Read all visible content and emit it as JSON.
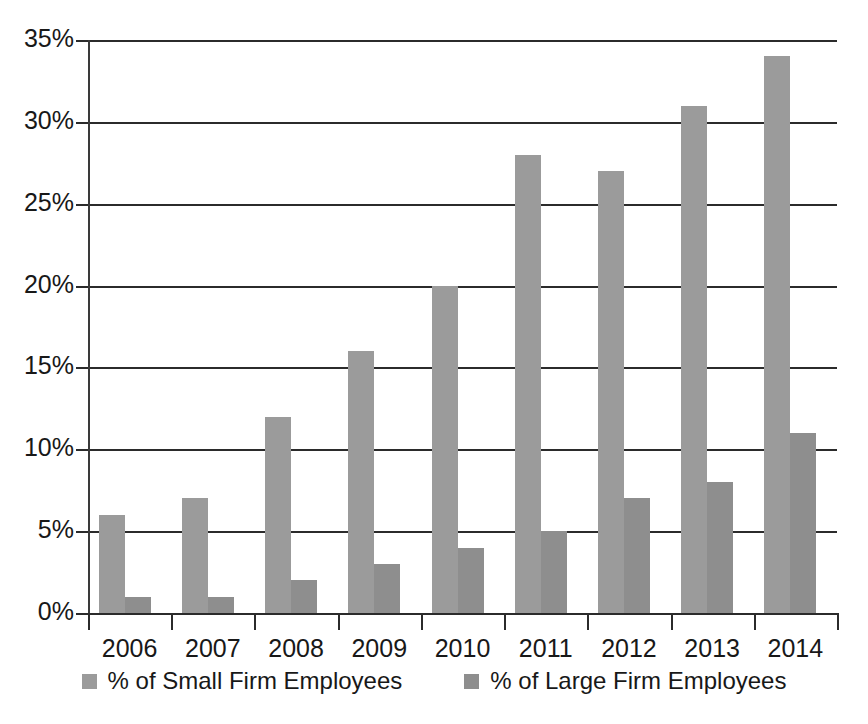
{
  "chart_data": {
    "type": "bar",
    "title": "",
    "subtitle": "",
    "xlabel": "",
    "ylabel": "",
    "categories": [
      "2006",
      "2007",
      "2008",
      "2009",
      "2010",
      "2011",
      "2012",
      "2013",
      "2014"
    ],
    "series": [
      {
        "name": "% of Small Firm Employees",
        "color": "#9b9b9b",
        "values": [
          6,
          7,
          12,
          16,
          20,
          28,
          27,
          31,
          34
        ]
      },
      {
        "name": "% of Large Firm Employees",
        "color": "#8e8e8e",
        "values": [
          1,
          1,
          2,
          3,
          4,
          5,
          7,
          8,
          11
        ]
      }
    ],
    "ylim": [
      0,
      35
    ],
    "ytick_values": [
      0,
      5,
      10,
      15,
      20,
      25,
      30,
      35
    ],
    "ytick_labels": [
      "0%",
      "5%",
      "10%",
      "15%",
      "20%",
      "25%",
      "30%",
      "35%"
    ],
    "grid": true,
    "grid_axis": "y",
    "legend_position": "bottom",
    "value_suffix": "%"
  },
  "axes": {
    "y_axis_name": "percent-axis",
    "x_axis_name": "year-axis"
  },
  "legend": {
    "items": [
      {
        "label": "% of Small Firm Employees",
        "swatch": "small-firm-swatch"
      },
      {
        "label": "% of Large Firm Employees",
        "swatch": "large-firm-swatch"
      }
    ]
  }
}
